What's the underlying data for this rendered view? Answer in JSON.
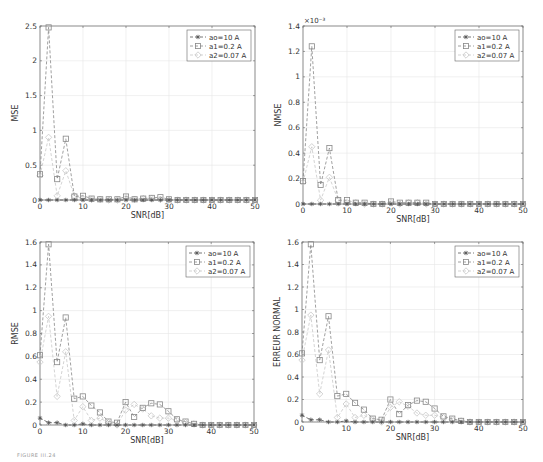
{
  "figure": {
    "caption": "FIGURE III.24"
  },
  "legend_labels": [
    "ao=10 A",
    "a1=0.2 A",
    "a2=0.07 A"
  ],
  "chart_data": [
    {
      "type": "line",
      "title": "",
      "xlabel": "SNR[dB]",
      "ylabel": "MSE",
      "xlim": [
        0,
        50
      ],
      "ylim": [
        0,
        2.5
      ],
      "yticks": [
        0,
        0.5,
        1,
        1.5,
        2,
        2.5
      ],
      "ytick_labels": [
        "0",
        "0.5",
        "1",
        "1.5",
        "2",
        "2.5"
      ],
      "xticks": [
        0,
        10,
        20,
        30,
        40,
        50
      ],
      "y_multiplier": "",
      "grid": true,
      "legend_position": "upper right",
      "x": [
        0,
        2,
        4,
        6,
        8,
        10,
        12,
        14,
        16,
        18,
        20,
        22,
        24,
        26,
        28,
        30,
        32,
        34,
        36,
        38,
        40,
        42,
        44,
        46,
        48,
        50
      ],
      "series": [
        {
          "name": "ao=10 A",
          "marker": "asterisk",
          "values": [
            0,
            0,
            0,
            0,
            0,
            0,
            0,
            0,
            0,
            0,
            0,
            0,
            0,
            0,
            0,
            0,
            0,
            0,
            0,
            0,
            0,
            0,
            0,
            0,
            0,
            0
          ]
        },
        {
          "name": "a1=0.2 A",
          "marker": "square",
          "values": [
            0.37,
            2.48,
            0.3,
            0.88,
            0.05,
            0.06,
            0.02,
            0.01,
            0.01,
            0.01,
            0.05,
            0.01,
            0.02,
            0.03,
            0.04,
            0.01,
            0,
            0,
            0,
            0,
            0,
            0,
            0,
            0,
            0,
            0
          ]
        },
        {
          "name": "a2=0.07 A",
          "marker": "diamond",
          "values": [
            0.35,
            0.9,
            0.06,
            0.42,
            0.06,
            0.02,
            0.01,
            0.01,
            0,
            0,
            0.03,
            0.01,
            0.02,
            0.02,
            0.01,
            0,
            0,
            0,
            0,
            0,
            0,
            0,
            0,
            0,
            0,
            0
          ]
        }
      ]
    },
    {
      "type": "line",
      "title": "",
      "xlabel": "SNR[dB]",
      "ylabel": "NMSE",
      "xlim": [
        0,
        50
      ],
      "ylim": [
        0,
        1.4
      ],
      "yticks": [
        0,
        0.2,
        0.4,
        0.6,
        0.8,
        1,
        1.2,
        1.4
      ],
      "ytick_labels": [
        "0",
        "0.2",
        "0.4",
        "0.6",
        "0.8",
        "1",
        "1.2",
        "1.4"
      ],
      "xticks": [
        0,
        10,
        20,
        30,
        40,
        50
      ],
      "y_multiplier": "×10⁻³",
      "grid": true,
      "legend_position": "upper right",
      "x": [
        0,
        2,
        4,
        6,
        8,
        10,
        12,
        14,
        16,
        18,
        20,
        22,
        24,
        26,
        28,
        30,
        32,
        34,
        36,
        38,
        40,
        42,
        44,
        46,
        48,
        50
      ],
      "series": [
        {
          "name": "ao=10 A",
          "marker": "asterisk",
          "values": [
            0,
            0,
            0,
            0,
            0,
            0,
            0,
            0,
            0,
            0,
            0,
            0,
            0,
            0,
            0,
            0,
            0,
            0,
            0,
            0,
            0,
            0,
            0,
            0,
            0,
            0
          ]
        },
        {
          "name": "a1=0.2 A",
          "marker": "square",
          "values": [
            0.18,
            1.24,
            0.15,
            0.44,
            0.03,
            0.03,
            0.01,
            0.01,
            0,
            0,
            0.02,
            0.01,
            0.01,
            0.01,
            0.01,
            0,
            0,
            0,
            0,
            0,
            0,
            0,
            0,
            0,
            0,
            0
          ]
        },
        {
          "name": "a2=0.07 A",
          "marker": "diamond",
          "values": [
            0.17,
            0.45,
            0.03,
            0.21,
            0.03,
            0.01,
            0.01,
            0,
            0,
            0,
            0.01,
            0,
            0.01,
            0.01,
            0,
            0,
            0,
            0,
            0,
            0,
            0,
            0,
            0,
            0,
            0,
            0
          ]
        }
      ]
    },
    {
      "type": "line",
      "title": "",
      "xlabel": "SNR[dB]",
      "ylabel": "RMSE",
      "xlim": [
        0,
        50
      ],
      "ylim": [
        0,
        1.6
      ],
      "yticks": [
        0,
        0.2,
        0.4,
        0.6,
        0.8,
        1,
        1.2,
        1.4,
        1.6
      ],
      "ytick_labels": [
        "0",
        "0.2",
        "0.4",
        "0.6",
        "0.8",
        "1",
        "1.2",
        "1.4",
        "1.6"
      ],
      "xticks": [
        0,
        10,
        20,
        30,
        40,
        50
      ],
      "y_multiplier": "",
      "grid": true,
      "legend_position": "upper right",
      "x": [
        0,
        2,
        4,
        6,
        8,
        10,
        12,
        14,
        16,
        18,
        20,
        22,
        24,
        26,
        28,
        30,
        32,
        34,
        36,
        38,
        40,
        42,
        44,
        46,
        48,
        50
      ],
      "series": [
        {
          "name": "ao=10 A",
          "marker": "asterisk",
          "values": [
            0.06,
            0.02,
            0.02,
            0,
            0,
            0.01,
            0,
            0,
            0,
            0,
            0,
            0,
            0,
            0,
            0,
            0,
            0,
            0,
            0,
            0,
            0,
            0,
            0,
            0,
            0,
            0
          ]
        },
        {
          "name": "a1=0.2 A",
          "marker": "square",
          "values": [
            0.61,
            1.58,
            0.55,
            0.94,
            0.23,
            0.25,
            0.17,
            0.11,
            0.03,
            0.02,
            0.2,
            0.07,
            0.15,
            0.19,
            0.18,
            0.12,
            0.05,
            0.03,
            0.01,
            0,
            0,
            0,
            0,
            0,
            0,
            0
          ]
        },
        {
          "name": "a2=0.07 A",
          "marker": "diamond",
          "values": [
            0.55,
            0.95,
            0.25,
            0.64,
            0.04,
            0.16,
            0.04,
            0.06,
            0.02,
            0,
            0.13,
            0.18,
            0.14,
            0.08,
            0.06,
            0.06,
            0.04,
            0.02,
            0.01,
            0,
            0,
            0,
            0,
            0,
            0,
            0
          ]
        }
      ]
    },
    {
      "type": "line",
      "title": "",
      "xlabel": "SNR[dB]",
      "ylabel": "ERREUR NORMAL",
      "xlim": [
        0,
        50
      ],
      "ylim": [
        0,
        1.6
      ],
      "yticks": [
        0,
        0.2,
        0.4,
        0.6,
        0.8,
        1,
        1.2,
        1.4,
        1.6
      ],
      "ytick_labels": [
        "0",
        "0.2",
        "0.4",
        "0.6",
        "0.8",
        "1",
        "1.2",
        "1.4",
        "1.6"
      ],
      "xticks": [
        0,
        10,
        20,
        30,
        40,
        50
      ],
      "y_multiplier": "",
      "grid": true,
      "legend_position": "upper right",
      "x": [
        0,
        2,
        4,
        6,
        8,
        10,
        12,
        14,
        16,
        18,
        20,
        22,
        24,
        26,
        28,
        30,
        32,
        34,
        36,
        38,
        40,
        42,
        44,
        46,
        48,
        50
      ],
      "series": [
        {
          "name": "ao=10 A",
          "marker": "asterisk",
          "values": [
            0.06,
            0.02,
            0.02,
            0,
            0,
            0.01,
            0,
            0,
            0,
            0,
            0,
            0,
            0,
            0,
            0,
            0,
            0,
            0,
            0,
            0,
            0,
            0,
            0,
            0,
            0,
            0
          ]
        },
        {
          "name": "a1=0.2 A",
          "marker": "square",
          "values": [
            0.61,
            1.58,
            0.55,
            0.94,
            0.23,
            0.25,
            0.17,
            0.11,
            0.03,
            0.02,
            0.2,
            0.07,
            0.15,
            0.19,
            0.18,
            0.12,
            0.05,
            0.03,
            0.01,
            0,
            0,
            0,
            0,
            0,
            0,
            0
          ]
        },
        {
          "name": "a2=0.07 A",
          "marker": "diamond",
          "values": [
            0.55,
            0.95,
            0.25,
            0.64,
            0.04,
            0.16,
            0.04,
            0.06,
            0.02,
            0,
            0.13,
            0.18,
            0.14,
            0.08,
            0.06,
            0.06,
            0.04,
            0.02,
            0.01,
            0,
            0,
            0,
            0,
            0,
            0,
            0
          ]
        }
      ]
    }
  ],
  "colors": {
    "series": [
      "#555555",
      "#888888",
      "#c8c8c8"
    ],
    "axis": "#666666",
    "grid": "#e6e6e6",
    "text": "#333333"
  }
}
